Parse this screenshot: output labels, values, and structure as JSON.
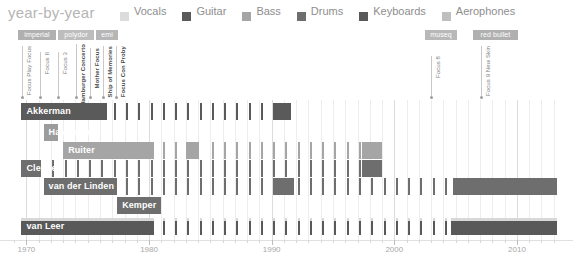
{
  "header": {
    "title": "year-by-year",
    "legend": [
      {
        "label": "Vocals",
        "color": "#dcdcdc",
        "name": "legend-vocals"
      },
      {
        "label": "Guitar",
        "color": "#5a5a5a",
        "name": "legend-guitar"
      },
      {
        "label": "Bass",
        "color": "#a5a5a5",
        "name": "legend-bass"
      },
      {
        "label": "Drums",
        "color": "#6e6e6e",
        "name": "legend-drums"
      },
      {
        "label": "Keyboards",
        "color": "#595959",
        "name": "legend-keyboards"
      },
      {
        "label": "Aerophones",
        "color": "#bfbfbf",
        "name": "legend-aerophones"
      }
    ]
  },
  "labels": [
    {
      "text": "imperial",
      "x": 18,
      "w": 38,
      "color": "#b0b0b0"
    },
    {
      "text": "polydor",
      "x": 58,
      "w": 36,
      "color": "#bdbdbd"
    },
    {
      "text": "emi",
      "x": 96,
      "w": 22,
      "color": "#b6b6b6"
    },
    {
      "text": "museq",
      "x": 425,
      "w": 32,
      "color": "#b8b8b8"
    },
    {
      "text": "red bullet",
      "x": 473,
      "w": 45,
      "color": "#b0b0b0"
    }
  ],
  "albums": [
    {
      "text": "Focus Play Focus",
      "x": 22,
      "bold": false,
      "top": 46,
      "height": 52
    },
    {
      "text": "Focus II",
      "x": 40,
      "bold": false,
      "top": 52,
      "height": 46
    },
    {
      "text": "Focus 3",
      "x": 58,
      "bold": false,
      "top": 52,
      "height": 46
    },
    {
      "text": "Hamburger Concerto",
      "x": 76,
      "bold": true,
      "top": 44,
      "height": 54
    },
    {
      "text": "Mother Focus",
      "x": 90,
      "bold": true,
      "top": 48,
      "height": 50
    },
    {
      "text": "Ship of Memories",
      "x": 103,
      "bold": true,
      "top": 46,
      "height": 52
    },
    {
      "text": "Focus Con Proby",
      "x": 116,
      "bold": true,
      "top": 46,
      "height": 52
    },
    {
      "text": "Focus 8",
      "x": 431,
      "bold": false,
      "top": 56,
      "height": 42
    },
    {
      "text": "Focus 9 New Skin",
      "x": 481,
      "bold": false,
      "top": 46,
      "height": 52
    }
  ],
  "axis": {
    "ticks": [
      {
        "year": 1970,
        "label": "1970",
        "major": true
      },
      {
        "year": 1980,
        "label": "1980",
        "major": true
      },
      {
        "year": 1990,
        "label": "1990",
        "major": true
      },
      {
        "year": 2000,
        "label": "2000",
        "major": true
      },
      {
        "year": 2010,
        "label": "2010",
        "major": true
      }
    ],
    "min": 1968.5,
    "max": 2014.0
  },
  "chart_data": {
    "type": "timeline",
    "title": "year-by-year",
    "xlabel": "",
    "ylabel": "",
    "xlim": [
      1968.5,
      2014.0
    ],
    "grid": true,
    "legend_position": "top",
    "roles": [
      "Vocals",
      "Guitar",
      "Bass",
      "Drums",
      "Keyboards",
      "Aerophones"
    ],
    "members": [
      {
        "name": "Akkerman",
        "role": "Guitar",
        "color": "#5a5a5a",
        "top": 103,
        "segments": [
          {
            "start": 1969.6,
            "end": 1976.6,
            "type": "solid"
          },
          {
            "start": 1976.6,
            "end": 1990.2,
            "type": "ticks"
          },
          {
            "start": 1990.2,
            "end": 1991.6,
            "type": "solid"
          }
        ]
      },
      {
        "name": "Havermans",
        "role": "Guitar",
        "color": "#9c9c9c",
        "top": 124,
        "segments": [
          {
            "start": 1971.4,
            "end": 1972.6,
            "type": "solid"
          }
        ]
      },
      {
        "name": "Ruiter",
        "role": "Bass",
        "color": "#a5a5a5",
        "top": 142,
        "segments": [
          {
            "start": 1973.0,
            "end": 1980.4,
            "type": "solid"
          },
          {
            "start": 1980.4,
            "end": 1983.0,
            "type": "ticks"
          },
          {
            "start": 1983.0,
            "end": 1984.1,
            "type": "solid"
          },
          {
            "start": 1984.1,
            "end": 1997.4,
            "type": "ticks"
          },
          {
            "start": 1997.4,
            "end": 1999.0,
            "type": "solid"
          }
        ]
      },
      {
        "name": "Cleuver",
        "role": "Drums",
        "color": "#6e6e6e",
        "top": 160,
        "segments": [
          {
            "start": 1969.6,
            "end": 1971.2,
            "type": "solid"
          },
          {
            "start": 1971.2,
            "end": 1997.4,
            "type": "ticks"
          },
          {
            "start": 1997.4,
            "end": 1999.0,
            "type": "solid"
          }
        ]
      },
      {
        "name": "van der Linden",
        "role": "Drums",
        "color": "#6e6e6e",
        "top": 178,
        "segments": [
          {
            "start": 1971.4,
            "end": 1977.4,
            "type": "solid"
          },
          {
            "start": 1977.4,
            "end": 1990.2,
            "type": "ticks"
          },
          {
            "start": 1990.2,
            "end": 1991.8,
            "type": "solid"
          },
          {
            "start": 1991.8,
            "end": 2001.6,
            "type": "ticks"
          },
          {
            "start": 2001.6,
            "end": 2004.8,
            "type": "ticks"
          },
          {
            "start": 2004.8,
            "end": 2013.3,
            "type": "solid"
          }
        ]
      },
      {
        "name": "Kemper",
        "role": "Drums",
        "color": "#6e6e6e",
        "top": 197,
        "segments": [
          {
            "start": 1977.4,
            "end": 1981.0,
            "type": "solid"
          }
        ]
      },
      {
        "name": "van Leer",
        "role": "Keyboards",
        "color": "#595959",
        "top": 218,
        "stripe": {
          "color": "#d8d8d8",
          "height": 3
        },
        "segments": [
          {
            "start": 1969.6,
            "end": 1980.4,
            "type": "solid"
          },
          {
            "start": 1980.4,
            "end": 2004.6,
            "type": "ticks"
          },
          {
            "start": 2004.6,
            "end": 2013.3,
            "type": "solid"
          }
        ]
      }
    ]
  }
}
